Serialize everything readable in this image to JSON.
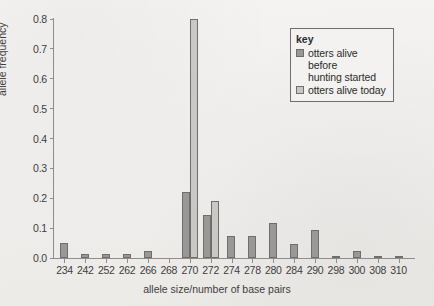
{
  "chart_data": {
    "type": "bar",
    "title": "",
    "xlabel": "allele size/number of base pairs",
    "ylabel": "allele frequency",
    "ylim": [
      0,
      0.8
    ],
    "yticks": [
      "0.0",
      "0.1",
      "0.2",
      "0.3",
      "0.4",
      "0.5",
      "0.6",
      "0.7",
      "0.8"
    ],
    "ytick_values": [
      0.0,
      0.1,
      0.2,
      0.3,
      0.4,
      0.5,
      0.6,
      0.7,
      0.8
    ],
    "grid": false,
    "legend_position": "top-right",
    "legend_title": "key",
    "categories": [
      "234",
      "242",
      "252",
      "262",
      "266",
      "268",
      "270",
      "272",
      "274",
      "278",
      "280",
      "284",
      "290",
      "298",
      "300",
      "308",
      "310"
    ],
    "series": [
      {
        "name": "otters alive before hunting started",
        "color": "#9a9896",
        "values": [
          0.05,
          0.015,
          0.015,
          0.012,
          0.022,
          0.0,
          0.22,
          0.145,
          0.073,
          0.073,
          0.118,
          0.047,
          0.095,
          0.005,
          0.023,
          0.007,
          0.005
        ]
      },
      {
        "name": "otters alive today",
        "color": "#cac8c5",
        "values": [
          0.0,
          0.0,
          0.0,
          0.0,
          0.0,
          0.0,
          0.8,
          0.19,
          0.0,
          0.0,
          0.0,
          0.0,
          0.0,
          0.0,
          0.0,
          0.0,
          0.0
        ]
      }
    ]
  },
  "legend": {
    "title": "key",
    "entries": [
      {
        "label_line1": "otters alive before",
        "label_line2": "hunting started",
        "color": "#9a9896"
      },
      {
        "label_line1": "otters alive today",
        "label_line2": "",
        "color": "#cac8c5"
      }
    ]
  },
  "axes": {
    "y_title": "allele frequency",
    "x_title": "allele size/number of base pairs"
  }
}
